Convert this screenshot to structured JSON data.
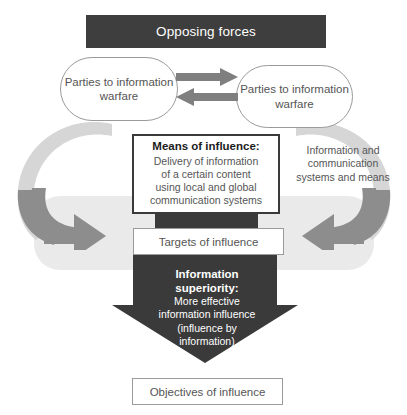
{
  "diagram": {
    "title": "Opposing forces",
    "banner": {
      "label": "Opposing forces"
    },
    "parties": {
      "left": {
        "label": "Parties to information warfare"
      },
      "right": {
        "label": "Parties to information warfare"
      }
    },
    "means": {
      "heading": "Means of influence:",
      "line1": "Delivery of information",
      "line2": "of a certain content",
      "line3": "using local and global",
      "line4": "communication systems"
    },
    "side_caption": {
      "line1": "Information and",
      "line2": "communication",
      "line3": "systems and means"
    },
    "targets": {
      "label": "Targets of influence"
    },
    "superiority": {
      "heading_line1": "Information",
      "heading_line2": "superiority:",
      "line1": "More effective",
      "line2": "information influence",
      "line3": "(influence by",
      "line4": "information)"
    },
    "objectives": {
      "label": "Objectives of influence"
    },
    "icons": {
      "exchange_right": "arrow-right-icon",
      "exchange_left": "arrow-left-icon",
      "loop_left": "curved-loop-arrow-icon",
      "loop_right": "curved-loop-arrow-icon",
      "down_arrow": "large-down-arrow-icon"
    },
    "colors": {
      "dark": "#3e3e3e",
      "arrow_gray": "#7f7f7f",
      "band_gray": "#eaeaea",
      "light_gray": "#c9c9c9",
      "text_gray": "#555555",
      "outline_gray": "#9a9a9a",
      "white": "#ffffff"
    }
  }
}
